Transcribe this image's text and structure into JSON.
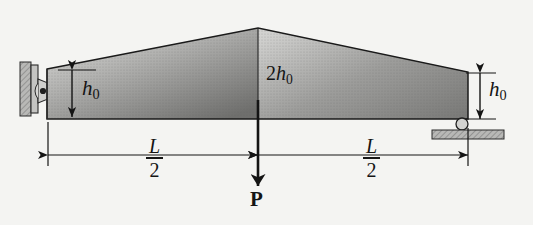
{
  "figure": {
    "background_color": "#f4f4f2",
    "line_color": "#141414"
  },
  "labels": {
    "height_left": {
      "var": "h",
      "sub": "0",
      "text": "h0"
    },
    "height_right": {
      "var": "h",
      "sub": "0",
      "text": "h0"
    },
    "height_center_coefficient": "2",
    "height_center_var": "h",
    "height_center_sub": "0",
    "span_left": {
      "numerator": "L",
      "denominator": "2"
    },
    "span_right": {
      "numerator": "L",
      "denominator": "2"
    },
    "load": "P"
  },
  "geometry": {
    "beam_left_x": 47,
    "beam_right_x": 468,
    "beam_bottom_y": 119,
    "beam_left_top_y": 69,
    "beam_apex_x": 258,
    "beam_apex_top_y": 28,
    "beam_right_top_y": 72,
    "dimension_line_y": 155,
    "load_arrow_tip_y": 186
  },
  "supports": {
    "left": "pin-support",
    "right": "roller-support"
  },
  "colors": {
    "beam_light": "#d8d8d6",
    "beam_dark": "#6e6e6c",
    "hatch": "#9a9a98",
    "outline": "#141414"
  }
}
